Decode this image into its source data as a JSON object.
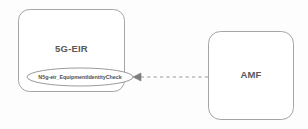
{
  "diagram": {
    "type": "3gpp-service-based-interface",
    "background_color": "#fdfdfd",
    "stroke_color": "#9a9a9a",
    "text_color": "#58595b",
    "nodes": [
      {
        "id": "eir",
        "label": "5G-EIR",
        "shape": "rounded-rectangle",
        "x": 18,
        "y": 9,
        "width": 107,
        "height": 83
      },
      {
        "id": "amf",
        "label": "AMF",
        "shape": "rounded-rectangle",
        "x": 208,
        "y": 31,
        "width": 86,
        "height": 89
      }
    ],
    "service": {
      "id": "n5g-eir-service",
      "label": "N5g-eir_EquipmentIdentityCheck",
      "shape": "ellipse",
      "x": 27,
      "y": 68,
      "width": 106,
      "height": 18
    },
    "connector": {
      "id": "amf-to-eir-service",
      "style": "dashed",
      "arrow_direction": "left",
      "from": "amf",
      "to": "n5g-eir-service",
      "x_start": 208,
      "x_end": 133,
      "y": 77
    }
  }
}
